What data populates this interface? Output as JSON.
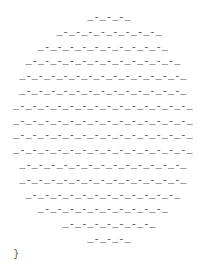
{
  "output": {
    "lines": [
      "            _-_-_-_",
      "       _-_-_-_-_-_-_-_-_",
      "    _-_-_-_-_-_-_-_-_-_-_",
      "  _-_-_-_-_-_-_-_-_-_-_-_-_",
      " _-_-_-_-_-_-_-_-_-_-_-_-_-_",
      " _-_-_-_-_-_-_-_-_-_-_-_-_-_",
      "_-_-_-_-_-_-_-_-_-_-_-_-_-_-_",
      "_-_-_-_-_-_-_-_-_-_-_-_-_-_-_",
      "_-_-_-_-_-_-_-_-_-_-_-_-_-_-_",
      "_-_-_-_-_-_-_-_-_-_-_-_-_-_-_",
      " _-_-_-_-_-_-_-_-_-_-_-_-_-_",
      " _-_-_-_-_-_-_-_-_-_-_-_-_-_",
      "  _-_-_-_-_-_-_-_-_-_-_-_-_",
      "    _-_-_-_-_-_-_-_-_-_-_",
      "        _-_-_-_-_-_-_-_",
      "            _-_-_-_",
      "}"
    ]
  }
}
